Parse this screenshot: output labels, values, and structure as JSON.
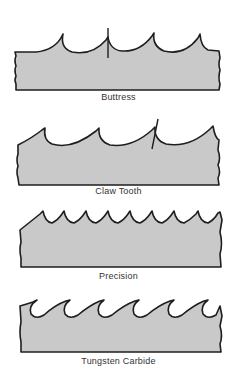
{
  "figure": {
    "blades": [
      {
        "id": "buttress",
        "label": "Buttress"
      },
      {
        "id": "claw-tooth",
        "label": "Claw Tooth"
      },
      {
        "id": "precision",
        "label": "Precision"
      },
      {
        "id": "tungsten-carbide",
        "label": "Tungsten Carbide"
      }
    ],
    "colors": {
      "blade_fill": "#c9c9c9",
      "outline": "#1e1e1e",
      "label_text": "#333333",
      "background": "#ffffff"
    }
  }
}
